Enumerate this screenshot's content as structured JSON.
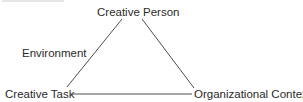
{
  "diagram": {
    "type": "triangle",
    "nodes": {
      "top": {
        "label": "Creative Person"
      },
      "bottom_left": {
        "label": "Creative Task"
      },
      "bottom_right": {
        "label": "Organizational Context"
      }
    },
    "side_label": "Environment",
    "edges": [
      {
        "from": "Creative Person",
        "to": "Creative Task"
      },
      {
        "from": "Creative Person",
        "to": "Organizational Context"
      },
      {
        "from": "Creative Task",
        "to": "Organizational Context"
      }
    ],
    "line_color": "#3a3a3a",
    "text_color": "#2a2a2a"
  }
}
